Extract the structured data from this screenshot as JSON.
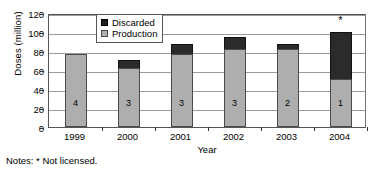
{
  "chart_data": {
    "type": "bar",
    "stacked": true,
    "title": "",
    "xlabel": "Year",
    "ylabel": "Doses (million)",
    "categories": [
      "1999",
      "2000",
      "2001",
      "2002",
      "2003",
      "2004"
    ],
    "series": [
      {
        "name": "Production",
        "color": "#aeaeae",
        "values": [
          77,
          62,
          77,
          82,
          82,
          51
        ]
      },
      {
        "name": "Discarded",
        "color": "#2b2b2b",
        "values": [
          0,
          9,
          10,
          13,
          5,
          49
        ]
      }
    ],
    "totals": [
      77,
      71,
      87,
      95,
      87,
      100
    ],
    "bar_labels": [
      "4",
      "3",
      "3",
      "3",
      "2",
      "1"
    ],
    "point_annotations": [
      {
        "category": "2004",
        "text": "*",
        "position": "above-bar"
      }
    ],
    "ylim": [
      0,
      120
    ],
    "y_ticks": [
      0,
      20,
      40,
      60,
      80,
      100,
      120
    ],
    "grid": true,
    "legend_position": "top-left-inside",
    "legend_entries": [
      "Discarded",
      "Production"
    ],
    "notes": "Notes: * Not licensed."
  },
  "axes": {
    "y_title": "Doses (million)",
    "x_title": "Year",
    "y_tick_labels": [
      "120",
      "100",
      "80",
      "60",
      "40",
      "20",
      "0"
    ],
    "x_tick_labels": [
      "1999",
      "2000",
      "2001",
      "2002",
      "2003",
      "2004"
    ]
  },
  "legend": {
    "items": [
      {
        "label": "Discarded",
        "swatch": "dark-square-swatch"
      },
      {
        "label": "Production",
        "swatch": "gray-square-swatch"
      }
    ]
  },
  "bars": [
    {
      "year": "1999",
      "count_label": "4",
      "production": 77,
      "discarded": 0,
      "total": 77,
      "note": ""
    },
    {
      "year": "2000",
      "count_label": "3",
      "production": 62,
      "discarded": 9,
      "total": 71,
      "note": ""
    },
    {
      "year": "2001",
      "count_label": "3",
      "production": 77,
      "discarded": 10,
      "total": 87,
      "note": ""
    },
    {
      "year": "2002",
      "count_label": "3",
      "production": 82,
      "discarded": 13,
      "total": 95,
      "note": ""
    },
    {
      "year": "2003",
      "count_label": "2",
      "production": 82,
      "discarded": 5,
      "total": 87,
      "note": ""
    },
    {
      "year": "2004",
      "count_label": "1",
      "production": 51,
      "discarded": 49,
      "total": 100,
      "note": "*"
    }
  ],
  "footnote": "Notes: * Not licensed."
}
